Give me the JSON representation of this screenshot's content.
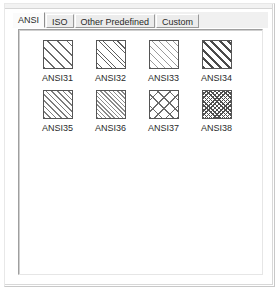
{
  "dialog": {
    "title": "Hatch Pattern Palette"
  },
  "tabs": [
    {
      "label": "ANSI",
      "selected": true,
      "name": "tab-ansi"
    },
    {
      "label": "ISO",
      "selected": false,
      "name": "tab-iso"
    },
    {
      "label": "Other Predefined",
      "selected": false,
      "name": "tab-other-predefined"
    },
    {
      "label": "Custom",
      "selected": false,
      "name": "tab-custom"
    }
  ],
  "patterns": [
    {
      "label": "ANSI31",
      "hatch": "hatch-ansi31",
      "description": "sparse 45-degree diagonal lines"
    },
    {
      "label": "ANSI32",
      "hatch": "hatch-ansi32",
      "description": "paired 45-degree diagonal lines"
    },
    {
      "label": "ANSI33",
      "hatch": "hatch-ansi33",
      "description": "light close 45-degree diagonal lines"
    },
    {
      "label": "ANSI34",
      "hatch": "hatch-ansi34",
      "description": "thick bold 45-degree diagonal lines"
    },
    {
      "label": "ANSI35",
      "hatch": "hatch-ansi35",
      "description": "medium dashed 45-degree diagonal lines"
    },
    {
      "label": "ANSI36",
      "hatch": "hatch-ansi36",
      "description": "dense dashed 45-degree diagonal lines"
    },
    {
      "label": "ANSI37",
      "hatch": "hatch-ansi37",
      "description": "crosshatch diamond grid"
    },
    {
      "label": "ANSI38",
      "hatch": "hatch-ansi38",
      "description": "dense crosshatch grid"
    }
  ],
  "colors": {
    "panel_background": "#ffffff",
    "tab_face": "#ececec",
    "tab_selected_face": "#fbfbfb",
    "swatch_border": "#555555",
    "text": "#2b2b2b"
  }
}
